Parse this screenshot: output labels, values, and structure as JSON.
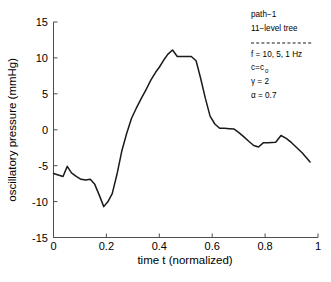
{
  "chart_data": {
    "type": "line",
    "title": "",
    "xlabel": "time t (normalized)",
    "ylabel": "oscillatory pressure (mmHg)",
    "xlim": [
      0,
      1
    ],
    "ylim": [
      -15,
      15
    ],
    "xticks": [
      "0",
      "0.2",
      "0.4",
      "0.6",
      "0.8",
      "1"
    ],
    "xtick_values": [
      0,
      0.2,
      0.4,
      0.6,
      0.8,
      1
    ],
    "yticks": [
      "15",
      "10",
      "5",
      "0",
      "-5",
      "-10",
      "-15"
    ],
    "ytick_values": [
      15,
      10,
      5,
      0,
      -5,
      -10,
      -15
    ],
    "grid": false,
    "legend_position": "top-right",
    "series": [
      {
        "name": "path-1",
        "color": "#1a1a1a",
        "x": [
          0.0,
          0.018,
          0.036,
          0.052,
          0.068,
          0.086,
          0.104,
          0.122,
          0.139,
          0.156,
          0.173,
          0.19,
          0.206,
          0.222,
          0.24,
          0.258,
          0.276,
          0.295,
          0.313,
          0.331,
          0.35,
          0.368,
          0.386,
          0.4,
          0.415,
          0.432,
          0.45,
          0.468,
          0.486,
          0.503,
          0.521,
          0.539,
          0.556,
          0.574,
          0.592,
          0.61,
          0.628,
          0.646,
          0.665,
          0.683,
          0.701,
          0.72,
          0.738,
          0.757,
          0.775,
          0.794,
          0.812,
          0.84,
          0.86,
          0.88,
          0.9,
          0.92,
          0.94,
          0.97
        ],
        "y": [
          -6.1,
          -6.3,
          -6.5,
          -5.1,
          -6.0,
          -6.5,
          -6.9,
          -7.0,
          -6.9,
          -7.6,
          -9.1,
          -10.7,
          -10.0,
          -8.9,
          -6.2,
          -3.0,
          -0.6,
          1.6,
          3.0,
          4.3,
          5.6,
          6.9,
          8.0,
          8.7,
          9.6,
          10.5,
          11.1,
          10.2,
          10.2,
          10.2,
          10.2,
          9.6,
          7.2,
          4.4,
          1.9,
          0.8,
          0.2,
          0.2,
          0.15,
          0.1,
          -0.4,
          -1.0,
          -1.6,
          -2.2,
          -2.4,
          -1.8,
          -1.8,
          -1.75,
          -0.8,
          -1.2,
          -1.8,
          -2.5,
          -3.2,
          -4.5
        ]
      }
    ],
    "annotations": {
      "line1": "path−1",
      "line2": "11−level tree",
      "separator": "dashed",
      "line3": "f = 10, 5, 1 Hz",
      "line4_main": "c=c",
      "line4_sub": "0",
      "line5": "γ = 2",
      "line6": "α = 0.7"
    }
  }
}
